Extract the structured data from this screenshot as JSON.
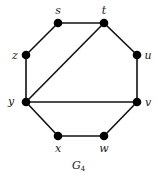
{
  "graph": {
    "caption": "G",
    "caption_sub": "4",
    "nodes": [
      {
        "id": "s",
        "label": "s",
        "x": 58,
        "y": 23,
        "lx": 58,
        "ly": 14
      },
      {
        "id": "t",
        "label": "t",
        "x": 104,
        "y": 23,
        "lx": 104,
        "ly": 14
      },
      {
        "id": "z",
        "label": "z",
        "x": 26,
        "y": 55,
        "lx": 15,
        "ly": 59
      },
      {
        "id": "u",
        "label": "u",
        "x": 137,
        "y": 55,
        "lx": 148,
        "ly": 59
      },
      {
        "id": "y",
        "label": "y",
        "x": 26,
        "y": 102,
        "lx": 11,
        "ly": 105
      },
      {
        "id": "v",
        "label": "v",
        "x": 137,
        "y": 102,
        "lx": 148,
        "ly": 106
      },
      {
        "id": "x",
        "label": "x",
        "x": 58,
        "y": 136,
        "lx": 58,
        "ly": 152
      },
      {
        "id": "w",
        "label": "w",
        "x": 104,
        "y": 136,
        "lx": 104,
        "ly": 152
      }
    ],
    "edges": [
      [
        "s",
        "t"
      ],
      [
        "t",
        "u"
      ],
      [
        "u",
        "v"
      ],
      [
        "v",
        "w"
      ],
      [
        "w",
        "x"
      ],
      [
        "x",
        "y"
      ],
      [
        "y",
        "z"
      ],
      [
        "z",
        "s"
      ],
      [
        "y",
        "t"
      ],
      [
        "y",
        "v"
      ]
    ]
  }
}
